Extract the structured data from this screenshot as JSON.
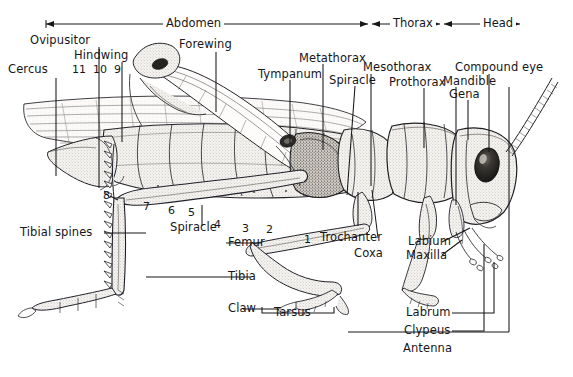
{
  "figure": {
    "body_regions": [
      {
        "name": "Abdomen",
        "label": "Abdomen"
      },
      {
        "name": "Thorax",
        "label": "Thorax"
      },
      {
        "name": "Head",
        "label": "Head"
      }
    ],
    "labels": {
      "cercus": "Cercus",
      "ovipositor": "Ovipusitor",
      "hindwing": "Hindwing",
      "forewing": "Forewing",
      "tympanum": "Tympanum",
      "metathorax": "Metathorax",
      "spiracle_thorax": "Spiracle",
      "mesothorax": "Mesothorax",
      "prothorax": "Prothorax",
      "compound_eye": "Compound eye",
      "mandible": "Mandible",
      "gena": "Gena",
      "tibial_spines": "Tibial spines",
      "spiracle_abdomen": "Spiracle",
      "femur": "Femur",
      "tibia": "Tibia",
      "claw": "Claw",
      "tarsus": "Tarsus",
      "trochanter": "Trochanter",
      "coxa": "Coxa",
      "labium": "Labium",
      "maxilla": "Maxilla",
      "labrum": "Labrum",
      "clypeus": "Clypeus",
      "antenna": "Antenna"
    },
    "segment_numbers": [
      "11",
      "10",
      "9",
      "8",
      "7",
      "6",
      "5",
      "4",
      "3",
      "2",
      "1"
    ],
    "colors": {
      "ink": "#16161a",
      "line": "#1a1a1e",
      "fill_light": "#f2f0ed",
      "fill_mid": "#dedbd6",
      "fill_dark": "#2a2a2c",
      "background": "#ffffff"
    }
  }
}
